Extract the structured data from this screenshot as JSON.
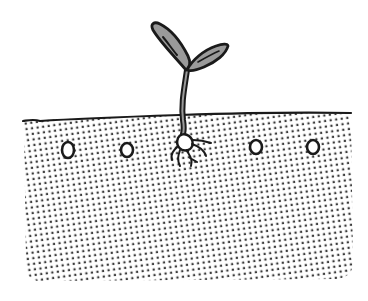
{
  "illustration": {
    "subject": "seedling sprouting from soil",
    "colors": {
      "background": "#ffffff",
      "outline": "#1a1a1a",
      "leaf_fill": "#9a9a9a",
      "stem_fill": "#8a8a8a",
      "soil_dot": "#3a3a3a",
      "seed_fill": "#ffffff"
    },
    "soil": {
      "pattern": "halftone-dots"
    },
    "seeds": [
      {
        "cx": 68,
        "cy": 150,
        "rx": 6,
        "ry": 8
      },
      {
        "cx": 127,
        "cy": 150,
        "rx": 6,
        "ry": 7
      },
      {
        "cx": 256,
        "cy": 147,
        "rx": 6,
        "ry": 7
      },
      {
        "cx": 313,
        "cy": 147,
        "rx": 6,
        "ry": 7
      }
    ],
    "sprout": {
      "leaves": 2,
      "roots": 5
    }
  }
}
